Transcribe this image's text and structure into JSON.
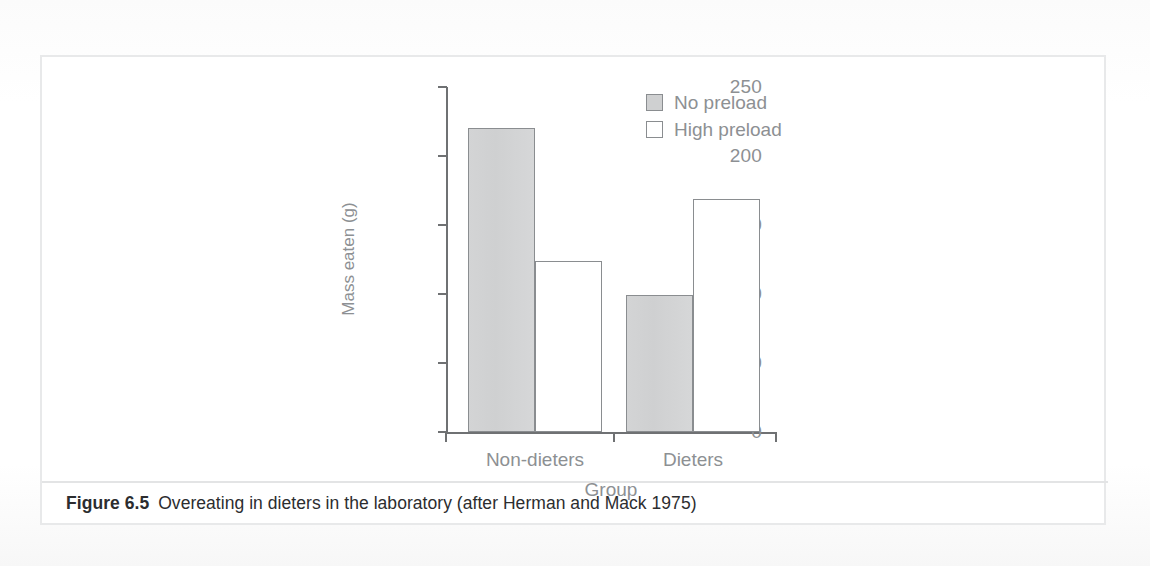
{
  "figure": {
    "caption_number": "Figure 6.5",
    "caption_text": "Overeating in dieters in the laboratory (after Herman and Mack 1975)"
  },
  "colors": {
    "no_preload_fill": "#cfd0d1",
    "high_preload_fill": "#ffffff",
    "bar_stroke": "#8a8d90",
    "axis": "#6f7173",
    "tick_label": "#8d9093",
    "caption": "#2c2d2f",
    "frame": "#e8e9ea"
  },
  "chart_data": {
    "type": "bar",
    "title": "",
    "subtitle": "",
    "xlabel": "Group",
    "ylabel": "Mass eaten (g)",
    "categories": [
      "Non-dieters",
      "Dieters"
    ],
    "series": [
      {
        "name": "No preload",
        "values": [
          220,
          99
        ]
      },
      {
        "name": "High preload",
        "values": [
          124,
          169
        ]
      }
    ],
    "ylim": [
      0,
      250
    ],
    "yticks": [
      0,
      50,
      100,
      150,
      200,
      250
    ],
    "ytick_labels": [
      "0",
      "50",
      "100",
      "150",
      "200",
      "250"
    ],
    "grid": false,
    "legend_position": "top-right",
    "annotations": []
  },
  "legend": {
    "items": [
      {
        "label": "No preload",
        "style": "filled"
      },
      {
        "label": "High preload",
        "style": "hollow"
      }
    ]
  }
}
